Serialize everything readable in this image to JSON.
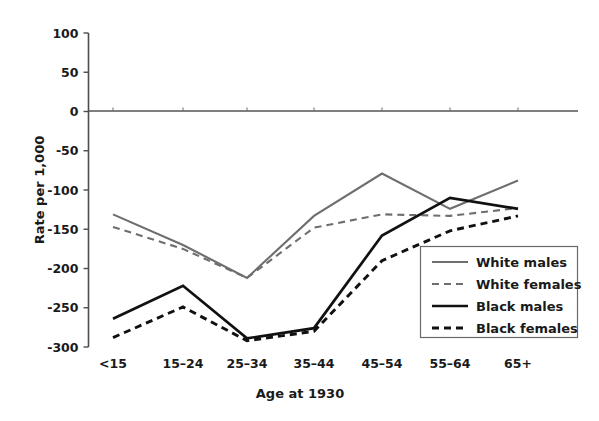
{
  "chart_data": {
    "type": "line",
    "title": "",
    "xlabel": "Age at 1930",
    "ylabel": "Rate per 1,000",
    "categories": [
      "<15",
      "15–24",
      "25–34",
      "35–44",
      "45–54",
      "55–64",
      "65+"
    ],
    "ylim": [
      -300,
      100
    ],
    "yticks": [
      100,
      50,
      0,
      -50,
      -100,
      -150,
      -200,
      -250,
      -300
    ],
    "ytick_labels": [
      "100",
      "50",
      "0",
      "-50",
      "-100",
      "-150",
      "-200",
      "-250",
      "-300"
    ],
    "grid": false,
    "legend_position": "lower-right",
    "zero_reference_line": true,
    "series": [
      {
        "name": "White males",
        "style": "solid",
        "color": "#6e6e6e",
        "values": [
          -131,
          -170,
          -212,
          -133,
          -79,
          -124,
          -88
        ]
      },
      {
        "name": "White females",
        "style": "dashed",
        "color": "#6e6e6e",
        "values": [
          -147,
          -175,
          -212,
          -148,
          -131,
          -133,
          -123
        ]
      },
      {
        "name": "Black males",
        "style": "solid",
        "color": "#111111",
        "values": [
          -264,
          -222,
          -289,
          -276,
          -158,
          -110,
          -124
        ]
      },
      {
        "name": "Black females",
        "style": "dashed",
        "color": "#111111",
        "values": [
          -288,
          -249,
          -292,
          -280,
          -190,
          -152,
          -133
        ]
      }
    ]
  },
  "legend": {
    "items": [
      {
        "label": "White males"
      },
      {
        "label": "White females"
      },
      {
        "label": "Black males"
      },
      {
        "label": "Black females"
      }
    ]
  }
}
